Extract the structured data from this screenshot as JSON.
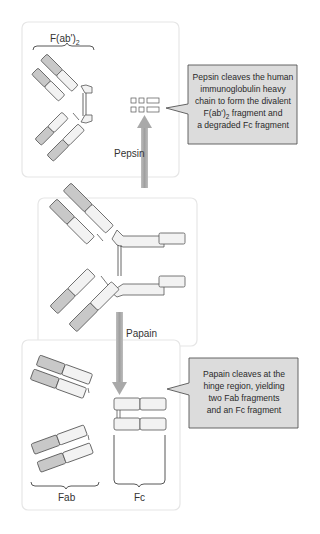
{
  "colors": {
    "panel_border": "#e4e4e4",
    "panel_fill": "#ffffff",
    "callout_fill": "#dcdcdc",
    "callout_border": "#555555",
    "domain_dark": "#c8c8c8",
    "domain_light": "#f2f2f2",
    "arrow": "#a9a9a9",
    "outline": "#555555"
  },
  "top_panel": {
    "label": "F(ab')",
    "label_sub": "2"
  },
  "arrows": {
    "pepsin_label": "Pepsin",
    "papain_label": "Papain"
  },
  "pepsin_callout": {
    "lines": [
      "Pepsin cleaves the human",
      "immunoglobulin heavy",
      "chain to form the divalent",
      "F(ab')",
      "a degraded Fc fragment"
    ],
    "line4_sub": "2",
    "line4_rest": " fragment and"
  },
  "papain_callout": {
    "lines": [
      "Papain cleaves at the",
      "hinge region, yielding",
      "two Fab fragments",
      "and an Fc fragment"
    ]
  },
  "bottom_panel": {
    "fab_label": "Fab",
    "fc_label": "Fc"
  }
}
